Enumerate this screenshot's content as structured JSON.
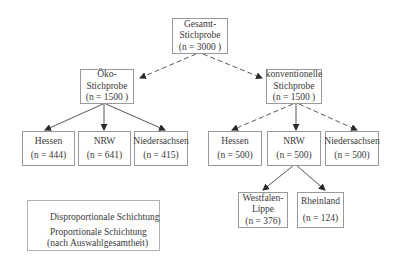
{
  "diagram": {
    "type": "sampling-tree",
    "nodes": {
      "root": {
        "line1": "Gesamt-",
        "line2": "Stichprobe",
        "n": "(n = 3000 )"
      },
      "oeko": {
        "line1": "Öko-",
        "line2": "Stichprobe",
        "n": "(n = 1500 )"
      },
      "konv": {
        "line1": "konventionelle",
        "line2": "Stichprobe",
        "n": "(n = 1500 )"
      },
      "oeko_hessen": {
        "label": "Hessen",
        "n": "(n = 444)"
      },
      "oeko_nrw": {
        "label": "NRW",
        "n": "(n = 641)"
      },
      "oeko_nds": {
        "label": "Niedersachsen",
        "n": "(n = 415)"
      },
      "konv_hessen": {
        "label": "Hessen",
        "n": "(n = 500)"
      },
      "konv_nrw": {
        "label": "NRW",
        "n": "(n = 500)"
      },
      "konv_nds": {
        "label": "Niedersachsen",
        "n": "(n = 500)"
      },
      "westfalen": {
        "line1": "Westfalen-",
        "line2": "Lippe",
        "n": "(n = 376)"
      },
      "rheinland": {
        "label": "Rheinland",
        "n": "(n = 124)"
      }
    },
    "edges": [
      {
        "from": "root",
        "to": "oeko",
        "style": "dashed"
      },
      {
        "from": "root",
        "to": "konv",
        "style": "dashed"
      },
      {
        "from": "oeko",
        "to": "oeko_hessen",
        "style": "solid"
      },
      {
        "from": "oeko",
        "to": "oeko_nrw",
        "style": "solid"
      },
      {
        "from": "oeko",
        "to": "oeko_nds",
        "style": "solid"
      },
      {
        "from": "konv",
        "to": "konv_hessen",
        "style": "dashed"
      },
      {
        "from": "konv",
        "to": "konv_nrw",
        "style": "solid"
      },
      {
        "from": "konv",
        "to": "konv_nds",
        "style": "dashed"
      },
      {
        "from": "konv_nrw",
        "to": "westfalen",
        "style": "solid"
      },
      {
        "from": "konv_nrw",
        "to": "rheinland",
        "style": "solid"
      }
    ],
    "legend": {
      "dashed_label": "Disproportionale Schichtung",
      "solid_label_1": "Proportionale Schichtung",
      "solid_label_2": "(nach Auswahlgesamtheit)"
    },
    "colors": {
      "line": "#3a3a3a",
      "box_border": "#9a9a9a"
    }
  }
}
